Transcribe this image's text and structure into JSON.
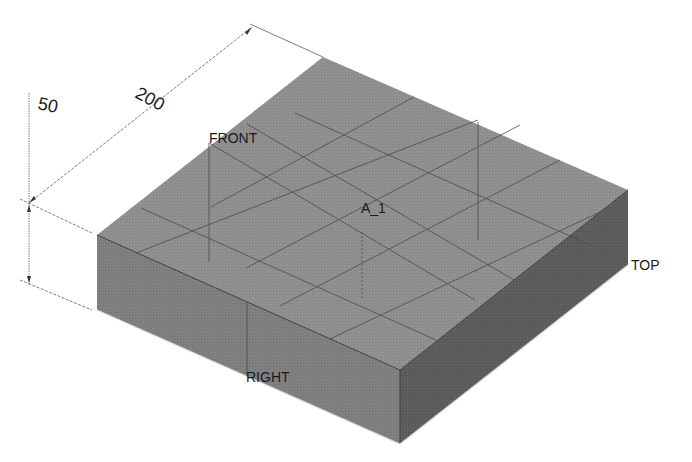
{
  "model": {
    "name": "isometric-block",
    "colors": {
      "top_face": "#8e8e8e",
      "left_face": "#828282",
      "right_face": "#5e5e5e",
      "edge": "#3a3a3a",
      "datum": "#4a4a4a",
      "dimension": "#555555",
      "background": "#ffffff"
    }
  },
  "dimensions": {
    "height": {
      "value": "50"
    },
    "length": {
      "value": "200"
    }
  },
  "datums": {
    "front": "FRONT",
    "right": "RIGHT",
    "top": "TOP",
    "axis": "A_1"
  }
}
